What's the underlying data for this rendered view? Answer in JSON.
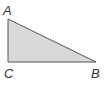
{
  "diagram": {
    "type": "right-triangle",
    "vertices": [
      {
        "label": "A",
        "x": 8,
        "y": 19
      },
      {
        "label": "B",
        "x": 96,
        "y": 62
      },
      {
        "label": "C",
        "x": 8,
        "y": 62
      }
    ],
    "right_angle_at": "C",
    "fill_color": "#d9d9d9",
    "stroke_color": "#555555"
  },
  "labels": {
    "a": "A",
    "b": "B",
    "c": "C"
  }
}
